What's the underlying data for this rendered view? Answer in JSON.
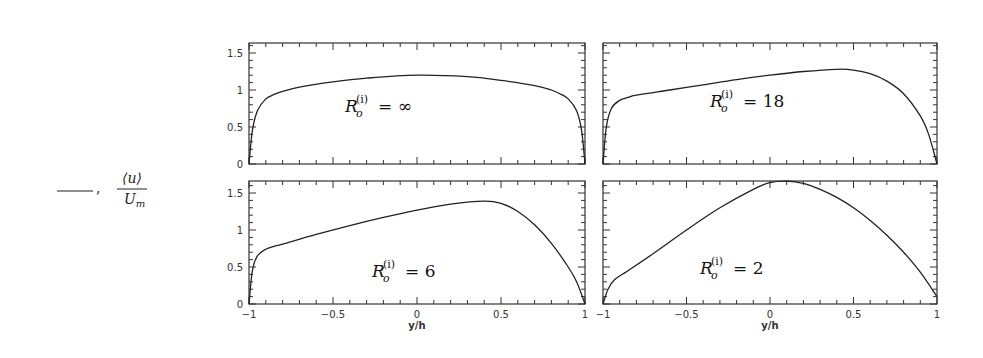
{
  "legend": {
    "line_symbol": "——",
    "separator": ",",
    "numerator": "⟨u⟩",
    "denominator": "U",
    "denominator_sub": "m"
  },
  "chart_data": {
    "type": "line",
    "layout": "2x2 panels",
    "xlabel": "y/h",
    "ylabel": "⟨u⟩/U_m",
    "xlim": [
      -1,
      1
    ],
    "ylim": [
      0,
      1.65
    ],
    "xticks": [
      -1,
      -0.5,
      0,
      0.5,
      1
    ],
    "xtick_labels": [
      "−1",
      "−0.5",
      "0",
      "0.5",
      "1"
    ],
    "yticks": [
      0,
      0.5,
      1,
      1.5
    ],
    "ytick_labels": [
      "0",
      "0.5",
      "1",
      "1.5"
    ],
    "grid": false,
    "panels": [
      {
        "position": "top-left",
        "annotation": "R_o^(i) = ∞",
        "annotation_value": "∞",
        "x": [
          -1,
          -0.98,
          -0.95,
          -0.9,
          -0.85,
          -0.8,
          -0.7,
          -0.5,
          -0.3,
          0,
          0.3,
          0.5,
          0.7,
          0.8,
          0.85,
          0.9,
          0.95,
          0.98,
          1
        ],
        "y": [
          0,
          0.45,
          0.72,
          0.88,
          0.94,
          0.98,
          1.04,
          1.11,
          1.16,
          1.2,
          1.18,
          1.13,
          1.06,
          1.0,
          0.95,
          0.88,
          0.72,
          0.45,
          0
        ]
      },
      {
        "position": "top-right",
        "annotation": "R_o^(i) = 18",
        "annotation_value": "18",
        "x": [
          -1,
          -0.98,
          -0.95,
          -0.9,
          -0.85,
          -0.8,
          -0.6,
          -0.4,
          -0.2,
          0,
          0.2,
          0.4,
          0.5,
          0.6,
          0.7,
          0.8,
          0.9,
          0.95,
          1
        ],
        "y": [
          0,
          0.5,
          0.75,
          0.86,
          0.9,
          0.93,
          1.0,
          1.07,
          1.14,
          1.2,
          1.25,
          1.28,
          1.27,
          1.22,
          1.12,
          0.95,
          0.65,
          0.4,
          0
        ]
      },
      {
        "position": "bottom-left",
        "annotation": "R_o^(i) = 6",
        "annotation_value": "6",
        "x": [
          -1,
          -0.98,
          -0.95,
          -0.9,
          -0.85,
          -0.8,
          -0.6,
          -0.4,
          -0.2,
          0,
          0.2,
          0.4,
          0.5,
          0.6,
          0.7,
          0.8,
          0.9,
          0.95,
          1
        ],
        "y": [
          0,
          0.45,
          0.65,
          0.74,
          0.78,
          0.81,
          0.94,
          1.06,
          1.17,
          1.27,
          1.35,
          1.39,
          1.36,
          1.25,
          1.07,
          0.82,
          0.5,
          0.3,
          0
        ]
      },
      {
        "position": "bottom-right",
        "annotation": "R_o^(i) = 2",
        "annotation_value": "2",
        "x": [
          -1,
          -0.97,
          -0.93,
          -0.85,
          -0.7,
          -0.5,
          -0.3,
          -0.1,
          0,
          0.1,
          0.2,
          0.3,
          0.4,
          0.5,
          0.6,
          0.7,
          0.8,
          0.9,
          1
        ],
        "y": [
          0,
          0.2,
          0.33,
          0.45,
          0.68,
          1.0,
          1.3,
          1.55,
          1.64,
          1.66,
          1.63,
          1.55,
          1.44,
          1.3,
          1.13,
          0.93,
          0.7,
          0.43,
          0.1
        ]
      }
    ]
  }
}
